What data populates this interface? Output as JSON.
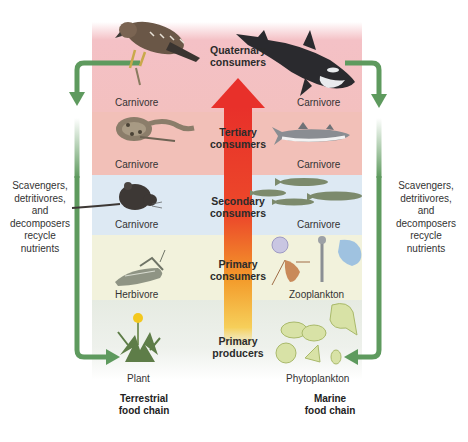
{
  "diagram": {
    "trophic_levels": [
      {
        "id": "quaternary",
        "line1": "Quaternary",
        "line2": "consumers",
        "band_color": "#f4c1c6"
      },
      {
        "id": "tertiary",
        "line1": "Tertiary",
        "line2": "consumers",
        "band_color": "#f2c0b8"
      },
      {
        "id": "secondary",
        "line1": "Secondary",
        "line2": "consumers",
        "band_color": "#dde9f3"
      },
      {
        "id": "primary_consumers",
        "line1": "Primary",
        "line2": "consumers",
        "band_color": "#f2f2dc"
      },
      {
        "id": "primary_producers",
        "line1": "Primary",
        "line2": "producers",
        "band_color": "#e6ebe2"
      }
    ],
    "terrestrial": {
      "title_line1": "Terrestrial",
      "title_line2": "food chain",
      "organisms": [
        {
          "level": "quaternary",
          "image": "hawk",
          "label": "Carnivore"
        },
        {
          "level": "tertiary",
          "image": "snake",
          "label": "Carnivore"
        },
        {
          "level": "secondary",
          "image": "mouse",
          "label": "Carnivore"
        },
        {
          "level": "primary_consumers",
          "image": "grasshopper",
          "label": "Herbivore"
        },
        {
          "level": "primary_producers",
          "image": "dandelion",
          "label": "Plant"
        }
      ]
    },
    "marine": {
      "title_line1": "Marine",
      "title_line2": "food chain",
      "organisms": [
        {
          "level": "quaternary",
          "image": "killer-whale",
          "label": "Carnivore"
        },
        {
          "level": "tertiary",
          "image": "shark",
          "label": "Carnivore"
        },
        {
          "level": "secondary",
          "image": "fish-school",
          "label": "Carnivore"
        },
        {
          "level": "primary_consumers",
          "image": "zooplankton",
          "label": "Zooplankton"
        },
        {
          "level": "primary_producers",
          "image": "phytoplankton",
          "label": "Phytoplankton"
        }
      ]
    },
    "recycle_note": {
      "line1": "Scavengers,",
      "line2": "detritivores,",
      "line3": "and",
      "line4": "decomposers",
      "line5": "recycle",
      "line6": "nutrients"
    },
    "colors": {
      "recycle_arrow": "#5e9a5e",
      "energy_arrow_top": "#e8302a",
      "energy_arrow_bottom": "#f5c542"
    }
  }
}
